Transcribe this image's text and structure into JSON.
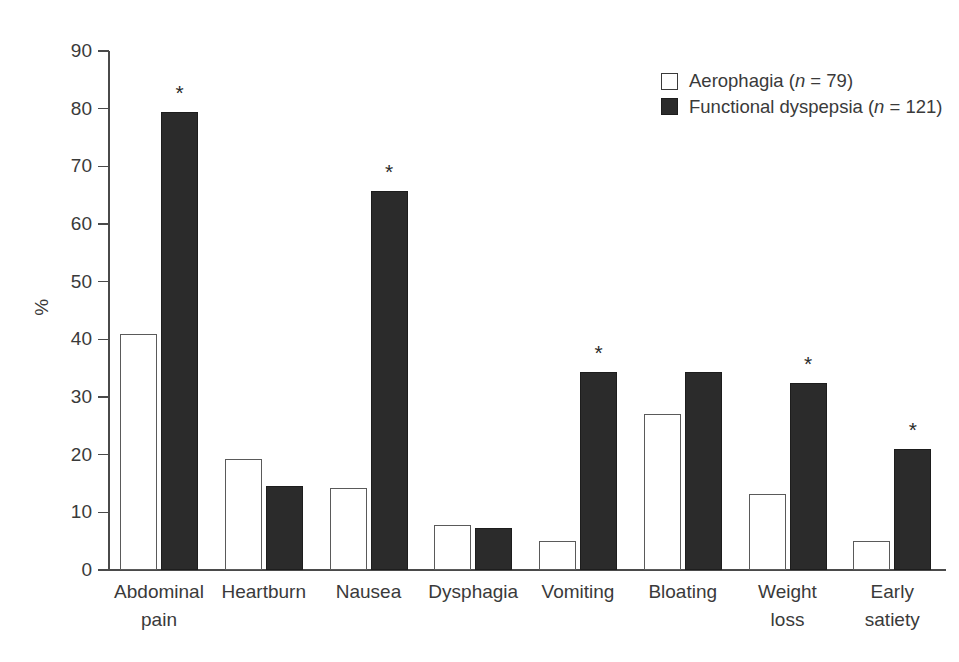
{
  "chart_data": {
    "type": "bar",
    "title": "",
    "xlabel": "",
    "ylabel": "%",
    "ylim": [
      0,
      90
    ],
    "yticks": [
      0,
      10,
      20,
      30,
      40,
      50,
      60,
      70,
      80,
      90
    ],
    "grid": false,
    "legend_position": "top-right",
    "categories": [
      "Abdominal pain",
      "Heartburn",
      "Nausea",
      "Dysphagia",
      "Vomiting",
      "Bloating",
      "Weight loss",
      "Early satiety"
    ],
    "category_lines": [
      [
        "Abdominal",
        "pain"
      ],
      [
        "Heartburn",
        ""
      ],
      [
        "Nausea",
        ""
      ],
      [
        "Dysphagia",
        ""
      ],
      [
        "Vomiting",
        ""
      ],
      [
        "Bloating",
        ""
      ],
      [
        "Weight",
        "loss"
      ],
      [
        "Early",
        "satiety"
      ]
    ],
    "series": [
      {
        "name": "Aerophagia",
        "n": 79,
        "legend_label": "Aerophagia (n = 79)",
        "style": "open",
        "color": "#ffffff",
        "edge_color": "#5a5a5a",
        "values": [
          41.0,
          19.3,
          14.3,
          7.8,
          5.0,
          27.0,
          13.2,
          5.0
        ]
      },
      {
        "name": "Functional dyspepsia",
        "n": 121,
        "legend_label": "Functional dyspepsia (n = 121)",
        "style": "filled",
        "color": "#2b2b2b",
        "edge_color": "#1d1d1d",
        "values": [
          79.4,
          14.5,
          65.8,
          7.2,
          34.3,
          34.3,
          32.4,
          21.0
        ]
      }
    ],
    "annotations": {
      "marker": "*",
      "significant_categories": [
        "Abdominal pain",
        "Nausea",
        "Vomiting",
        "Weight loss",
        "Early satiety"
      ],
      "significant_flags": [
        true,
        false,
        true,
        false,
        true,
        false,
        true,
        true
      ]
    }
  },
  "legend": {
    "items": [
      {
        "label_text": "Aerophagia (",
        "n_symbol": "n",
        "n_value": " = 79)",
        "style": "open"
      },
      {
        "label_text": "Functional dyspepsia (",
        "n_symbol": "n",
        "n_value": " = 121)",
        "style": "filled"
      }
    ]
  }
}
